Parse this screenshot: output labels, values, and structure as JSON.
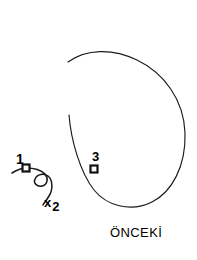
{
  "figure": {
    "background_color": "#ffffff",
    "stroke_color": "#1a1a1a",
    "width": 197,
    "height": 260,
    "caption": "ÖNCEKİ",
    "labels": {
      "point_one": "1",
      "point_three": "3",
      "axis_x": "x",
      "axis_x_subscript": "2"
    },
    "markers": [
      {
        "id": "1",
        "x": 26,
        "y": 168,
        "shape": "square"
      },
      {
        "id": "3",
        "x": 94,
        "y": 169,
        "shape": "square"
      }
    ],
    "paths": {
      "loop": "M 68,62 C 86,49 112,48 137,60 C 164,73 184,100 185,133 C 186,166 172,192 152,202 C 130,213 106,205 94,190 C 80,172 71,140 69,115",
      "squiggle": "M 12,173 C 17,170 22,168 26,168 C 34,168 41,170 45,174 C 49,179 47,185 42,186 C 37,187 33,183 35,179 C 37,174 44,173 48,176 C 53,180 53,190 49,196 C 46,201 44,203 43,205",
      "x_tick": "M 44,199 L 52,208 M 52,199 L 44,208"
    }
  }
}
